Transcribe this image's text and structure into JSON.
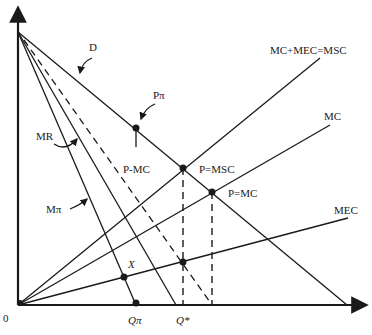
{
  "diagram": {
    "type": "economics-externality-monopoly",
    "origin_label": "0",
    "curves": {
      "demand": "D",
      "marginal_revenue": "MR",
      "marginal_profit": "Mπ",
      "price_minus_mc": "P-MC",
      "marginal_social_cost": "MC+MEC=MSC",
      "marginal_cost": "MC",
      "marginal_external_cost": "MEC"
    },
    "points": {
      "monopoly_price": "Pπ",
      "p_equals_msc": "P=MSC",
      "p_equals_mc": "P=MC",
      "x_point": "X"
    },
    "axis_labels": {
      "q_pi": "Qπ",
      "q_star": "Q*"
    },
    "colors": {
      "ink": "#1a1a1a",
      "background": "#ffffff"
    }
  }
}
